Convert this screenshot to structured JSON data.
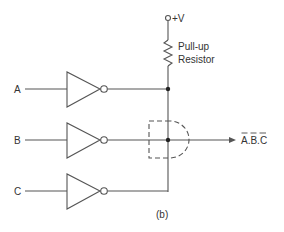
{
  "diagram": {
    "supply_label": "+V",
    "resistor_label_line1": "Pull-up",
    "resistor_label_line2": "Resistor",
    "inputs": [
      {
        "label": "A"
      },
      {
        "label": "B"
      },
      {
        "label": "C"
      }
    ],
    "output_label": "A.B.C",
    "caption": "(b)",
    "line_color": "#555555"
  }
}
